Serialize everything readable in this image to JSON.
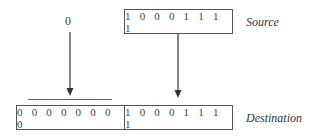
{
  "diagram": {
    "source": {
      "label": "Source",
      "bits": "1 0 0 0 1 1 1 1"
    },
    "fill_value": "0",
    "destination": {
      "label": "Destination",
      "high_bits": "0 0 0 0 0 0 0 0",
      "low_bits": "1 0 0 0 1 1 1 1"
    }
  }
}
